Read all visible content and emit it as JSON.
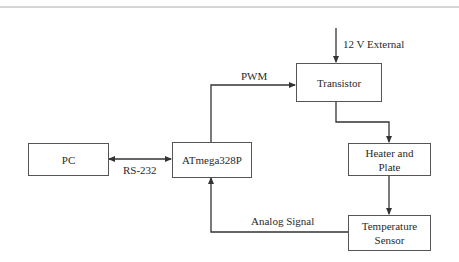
{
  "diagram": {
    "type": "block-diagram",
    "blocks": {
      "pc": {
        "label": "PC"
      },
      "mcu": {
        "label": "ATmega328P"
      },
      "transistor": {
        "label": "Transistor"
      },
      "heater": {
        "label_line1": "Heater and",
        "label_line2": "Plate"
      },
      "sensor": {
        "label_line1": "Temperature",
        "label_line2": "Sensor"
      }
    },
    "connections": {
      "ext_power": {
        "label": "12 V External",
        "from": "external",
        "to": "transistor"
      },
      "pwm": {
        "label": "PWM",
        "from": "mcu",
        "to": "transistor"
      },
      "serial": {
        "label": "RS-232",
        "from": "pc",
        "to": "mcu",
        "bidirectional": true
      },
      "drive": {
        "label": "",
        "from": "transistor",
        "to": "heater"
      },
      "thermal": {
        "label": "",
        "from": "heater",
        "to": "sensor"
      },
      "analog": {
        "label": "Analog Signal",
        "from": "sensor",
        "to": "mcu"
      }
    },
    "colors": {
      "line": "#333333",
      "box_border": "#555555",
      "rule": "#d4d4d4"
    }
  }
}
